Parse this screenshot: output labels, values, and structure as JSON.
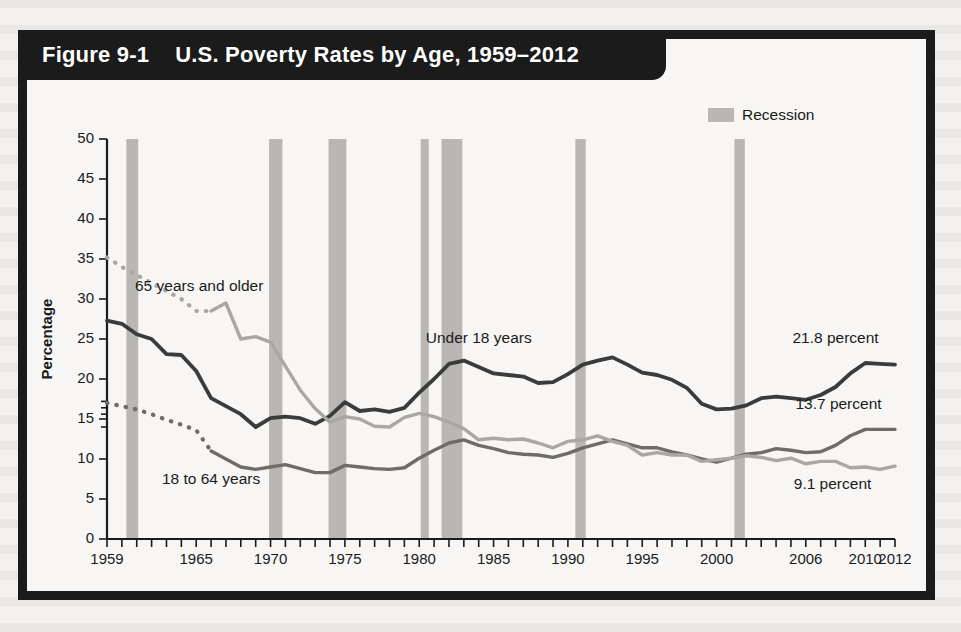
{
  "figure": {
    "number": "Figure 9-1",
    "title": "U.S. Poverty Rates by Age, 1959–2012"
  },
  "legend": {
    "recession_label": "Recession",
    "recession_color": "#b9b7b4"
  },
  "chart_data": {
    "type": "line",
    "title": "U.S. Poverty Rates by Age, 1959–2012",
    "xlabel": "",
    "ylabel": "Percentage",
    "xlim": [
      1959,
      2012
    ],
    "ylim": [
      0,
      50
    ],
    "ytick_labels": [
      "0",
      "5",
      "10",
      "15",
      "20",
      "25",
      "30",
      "35",
      "40",
      "45",
      "50"
    ],
    "yticks": [
      0,
      5,
      10,
      15,
      20,
      25,
      30,
      35,
      40,
      45,
      50
    ],
    "xtick_labels": [
      "1959",
      "1965",
      "1970",
      "1975",
      "1980",
      "1985",
      "1990",
      "1995",
      "2000",
      "2006",
      "2010",
      "2012"
    ],
    "xticks": [
      1959,
      1965,
      1970,
      1975,
      1980,
      1985,
      1990,
      1995,
      2000,
      2006,
      2010,
      2012
    ],
    "grid": false,
    "legend_position": "top-right",
    "x": [
      1959,
      1960,
      1961,
      1962,
      1963,
      1964,
      1965,
      1966,
      1967,
      1968,
      1969,
      1970,
      1971,
      1972,
      1973,
      1974,
      1975,
      1976,
      1977,
      1978,
      1979,
      1980,
      1981,
      1982,
      1983,
      1984,
      1985,
      1986,
      1987,
      1988,
      1989,
      1990,
      1991,
      1992,
      1993,
      1994,
      1995,
      1996,
      1997,
      1998,
      1999,
      2000,
      2001,
      2002,
      2003,
      2004,
      2005,
      2006,
      2007,
      2008,
      2009,
      2010,
      2011,
      2012
    ],
    "series": [
      {
        "name": "Under 18 years",
        "color": "#3b3b3b",
        "end_value_label": "21.8 percent",
        "style": "solid",
        "values": [
          27.3,
          26.9,
          25.6,
          25.0,
          23.1,
          23.0,
          21.0,
          17.6,
          16.6,
          15.6,
          14.0,
          15.1,
          15.3,
          15.1,
          14.4,
          15.4,
          17.1,
          16.0,
          16.2,
          15.9,
          16.4,
          18.3,
          20.0,
          21.9,
          22.3,
          21.5,
          20.7,
          20.5,
          20.3,
          19.5,
          19.6,
          20.6,
          21.8,
          22.3,
          22.7,
          21.8,
          20.8,
          20.5,
          19.9,
          18.9,
          16.9,
          16.2,
          16.3,
          16.7,
          17.6,
          17.8,
          17.6,
          17.4,
          18.0,
          19.0,
          20.7,
          22.0,
          21.9,
          21.8
        ]
      },
      {
        "name": "18 to 64 years",
        "color": "#6e6c6b",
        "end_value_label": "13.7 percent",
        "style": "dotted-then-solid",
        "solid_from": 1966,
        "values": [
          17.0,
          16.6,
          16.2,
          15.6,
          14.9,
          14.3,
          13.6,
          11.0,
          10.0,
          9.0,
          8.7,
          9.0,
          9.3,
          8.8,
          8.3,
          8.3,
          9.2,
          9.0,
          8.8,
          8.7,
          8.9,
          10.1,
          11.1,
          12.0,
          12.4,
          11.7,
          11.3,
          10.8,
          10.6,
          10.5,
          10.2,
          10.7,
          11.4,
          11.9,
          12.4,
          11.9,
          11.4,
          11.4,
          10.9,
          10.5,
          10.0,
          9.6,
          10.1,
          10.6,
          10.8,
          11.3,
          11.1,
          10.8,
          10.9,
          11.7,
          12.9,
          13.7,
          13.7,
          13.7
        ]
      },
      {
        "name": "65 years and older",
        "color": "#a9a7a5",
        "end_value_label": "9.1 percent",
        "style": "dotted-then-solid",
        "solid_from": 1966,
        "values": [
          35.2,
          34.0,
          33.0,
          32.0,
          31.0,
          30.0,
          28.5,
          28.5,
          29.5,
          25.0,
          25.3,
          24.6,
          21.6,
          18.6,
          16.3,
          14.6,
          15.3,
          15.0,
          14.1,
          14.0,
          15.2,
          15.7,
          15.3,
          14.6,
          13.8,
          12.4,
          12.6,
          12.4,
          12.5,
          12.0,
          11.4,
          12.2,
          12.4,
          12.9,
          12.2,
          11.7,
          10.5,
          10.8,
          10.5,
          10.5,
          9.7,
          9.9,
          10.1,
          10.4,
          10.2,
          9.8,
          10.1,
          9.4,
          9.7,
          9.7,
          8.9,
          9.0,
          8.7,
          9.1
        ]
      }
    ],
    "recessions": [
      {
        "start": 1960.3,
        "end": 1961.1
      },
      {
        "start": 1969.9,
        "end": 1970.8
      },
      {
        "start": 1973.9,
        "end": 1975.1
      },
      {
        "start": 1980.1,
        "end": 1980.6
      },
      {
        "start": 1981.5,
        "end": 1982.9
      },
      {
        "start": 1990.5,
        "end": 1991.2
      },
      {
        "start": 2001.2,
        "end": 2001.9
      }
    ],
    "annotations": [
      {
        "text": "65 years and older",
        "x": 1965.2,
        "y": 31.0
      },
      {
        "text": "Under 18 years",
        "x": 1984.0,
        "y": 24.5
      },
      {
        "text": "18 to 64 years",
        "x": 1966.0,
        "y": 6.9
      },
      {
        "text": "21.8 percent",
        "x": 2008.0,
        "y": 24.5
      },
      {
        "text": "13.7 percent",
        "x": 2008.2,
        "y": 16.2
      },
      {
        "text": "9.1 percent",
        "x": 2007.8,
        "y": 6.3
      }
    ]
  }
}
